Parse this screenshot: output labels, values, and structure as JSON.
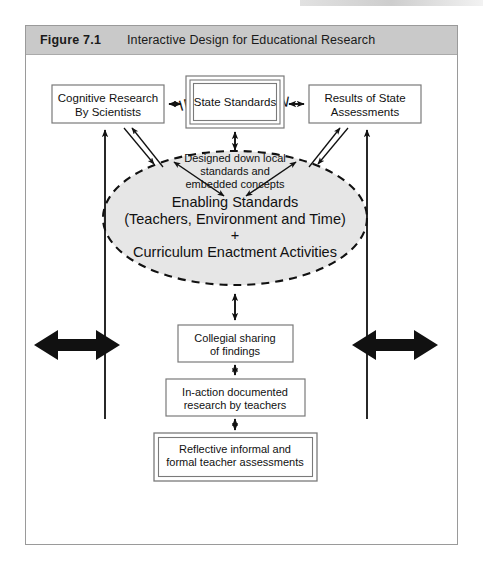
{
  "figure": {
    "number": "Figure 7.1",
    "title": "Interactive Design for Educational Research",
    "header_bg": "#c9c9c9",
    "frame_border": "#9a9a9a"
  },
  "nodes": {
    "cognitive_research": {
      "line1": "Cognitive Research",
      "line2": "By Scientists",
      "shape": "rect",
      "border": "single"
    },
    "state_standards": {
      "line1": "State Standards",
      "shape": "rect",
      "border": "triple"
    },
    "results_of_state_assessments": {
      "line1": "Results of State",
      "line2": "Assessments",
      "shape": "rect",
      "border": "single"
    },
    "designed_down": {
      "line1": "Designed down local",
      "line2": "standards and",
      "line3": "embedded concepts",
      "shape": "text",
      "border": "none"
    },
    "instruction_ellipse": {
      "heading": "INSTRUCTION",
      "line1": "Enabling Standards",
      "line2": "(Teachers, Environment and Time)",
      "line3": "+",
      "line4": "Curriculum Enactment Activities",
      "shape": "ellipse",
      "border": "dashed",
      "fill": "#e6e6e6"
    },
    "collegial_sharing": {
      "line1": "Collegial sharing",
      "line2": "of findings",
      "shape": "rect",
      "border": "single"
    },
    "in_action_research": {
      "line1": "In-action documented",
      "line2": "research by teachers",
      "shape": "rect",
      "border": "single"
    },
    "reflective_assessments": {
      "line1": "Reflective informal and",
      "line2": "formal teacher assessments",
      "shape": "rect",
      "border": "double"
    }
  },
  "connectors": {
    "cognitive_to_standards": "double-headed horizontal arrow",
    "standards_to_results": "double-headed horizontal arrow",
    "standards_to_designed_down": "double-headed vertical arrow",
    "designed_down_to_instruction_left": "double-headed diagonal arrow",
    "designed_down_to_instruction_right": "double-headed diagonal arrow",
    "cognitive_to_instruction": "diagonal arrow to ellipse",
    "results_to_instruction": "diagonal arrow to ellipse",
    "instruction_to_cognitive": "diagonal arrow to cognitive research",
    "instruction_to_results": "diagonal arrow to results",
    "instruction_to_collegial": "double-headed vertical arrow",
    "collegial_to_in_action": "double-headed vertical arrow",
    "in_action_to_reflective": "double-headed vertical arrow",
    "left_feedback_loop": "bold double-headed arrow into left riser",
    "right_feedback_loop": "bold double-headed arrow into right riser",
    "left_riser": "vertical arrow up to Cognitive Research By Scientists",
    "right_riser": "vertical arrow up to Results of State Assessments"
  },
  "colors": {
    "stroke": "#111111",
    "box_border": "#7a7a7a",
    "ellipse_fill": "#e6e6e6",
    "header_bg": "#c9c9c9"
  }
}
